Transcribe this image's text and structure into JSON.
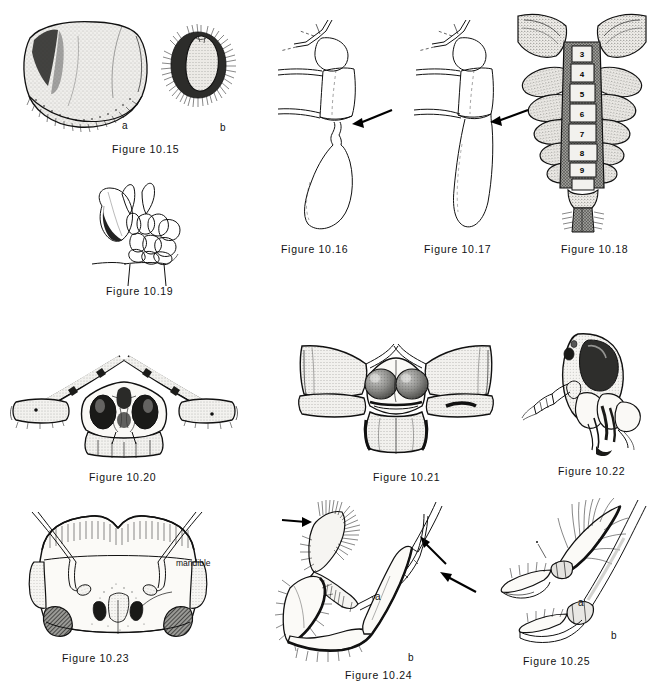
{
  "plate": {
    "title": "Insect morphology figure plate",
    "background_color": "#ffffff",
    "ink_color": "#111111"
  },
  "figures": [
    {
      "id": "fig-10-15",
      "caption": "Figure 10.15",
      "description": "Two shield-like sclerites, one large smooth with fringed margin and one small densely setose",
      "sublabels": [
        "a",
        "b"
      ]
    },
    {
      "id": "fig-10-16",
      "caption": "Figure 10.16",
      "description": "Lateral view of thorax and abdomen base with arrow indicating constriction",
      "annotations": [
        "arrow"
      ]
    },
    {
      "id": "fig-10-17",
      "caption": "Figure 10.17",
      "description": "Lateral view of thorax and abdomen base with arrow indicating broad junction",
      "annotations": [
        "arrow"
      ]
    },
    {
      "id": "fig-10-18",
      "caption": "Figure 10.18",
      "description": "Dorsal view of abdomen with numbered segments",
      "segment_numbers": [
        "3",
        "4",
        "5",
        "6",
        "7",
        "8",
        "9"
      ]
    },
    {
      "id": "fig-10-19",
      "caption": "Figure 10.19",
      "description": "Lateral view of wing base and scutellum region"
    },
    {
      "id": "fig-10-20",
      "caption": "Figure 10.20",
      "description": "Frontal view of stalk-eyed fly head with long eye stalks"
    },
    {
      "id": "fig-10-21",
      "caption": "Figure 10.21",
      "description": "Frontal view of insect head with large compound eyes and lateral projections"
    },
    {
      "id": "fig-10-22",
      "caption": "Figure 10.22",
      "description": "Lateral oblique view of head showing antenna and mouthparts"
    },
    {
      "id": "fig-10-23",
      "caption": "Figure 10.23",
      "description": "Frontal view of head with labelled mandible and antennae",
      "annotations": [
        "mandible"
      ]
    },
    {
      "id": "fig-10-24",
      "caption": "Figure 10.24",
      "description": "Two legs compared, densely setose and smooth, with arrows at tibial spurs",
      "sublabels": [
        "a",
        "b"
      ],
      "annotations": [
        "arrow",
        "arrow",
        "arrow"
      ]
    },
    {
      "id": "fig-10-25",
      "caption": "Figure 10.25",
      "description": "Two tarsal claw structures compared",
      "sublabels": [
        "a",
        "b"
      ]
    }
  ],
  "labels": {
    "mandible": "mandible",
    "a": "a",
    "b": "b"
  }
}
